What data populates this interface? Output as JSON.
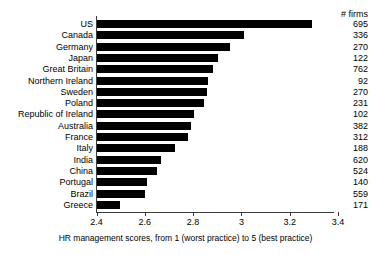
{
  "chart_data": {
    "type": "bar",
    "orientation": "horizontal",
    "title": "",
    "xlabel": "HR management scores, from 1 (worst practice) to 5 (best practice)",
    "ylabel": "",
    "xlim": [
      2.4,
      3.4
    ],
    "xticks": [
      2.4,
      2.6,
      2.8,
      3.0,
      3.2,
      3.4
    ],
    "xtick_labels": [
      "2.4",
      "2.6",
      "2.8",
      "3",
      "3.2",
      "3.4"
    ],
    "grid": false,
    "legend": null,
    "bar_color": "#000000",
    "axis_color": "#3a3a3a",
    "categories": [
      "US",
      "Canada",
      "Germany",
      "Japan",
      "Great Britain",
      "Northern Ireland",
      "Sweden",
      "Poland",
      "Republic of Ireland",
      "Australia",
      "France",
      "Italy",
      "India",
      "China",
      "Portugal",
      "Brazil",
      "Greece"
    ],
    "values": [
      3.29,
      3.01,
      2.95,
      2.9,
      2.88,
      2.86,
      2.855,
      2.845,
      2.8,
      2.79,
      2.775,
      2.725,
      2.665,
      2.65,
      2.605,
      2.6,
      2.495
    ],
    "annotation_column": {
      "header": "# firms",
      "values": [
        695,
        336,
        270,
        122,
        762,
        92,
        270,
        231,
        102,
        382,
        312,
        188,
        620,
        524,
        140,
        559,
        171
      ]
    }
  }
}
